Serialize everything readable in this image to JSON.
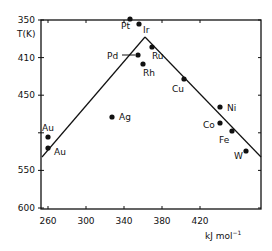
{
  "chart_data": {
    "type": "scatter",
    "title": "",
    "ylabel": "T(K)",
    "xlabel": "kJ mol⁻¹",
    "x_ticks": [
      260,
      300,
      340,
      380,
      420
    ],
    "y_ticks": [
      {
        "label": "350",
        "px": 20
      },
      {
        "label": "410",
        "px": 57.6
      },
      {
        "label": "450",
        "px": 95.2
      },
      {
        "label": "",
        "px": 132.8
      },
      {
        "label": "550",
        "px": 170.4
      },
      {
        "label": "600",
        "px": 208
      }
    ],
    "xlim": [
      253,
      480
    ],
    "ylim_labels": [
      "350",
      "600"
    ],
    "grid": false,
    "legend": null,
    "points": [
      {
        "name": "Pt",
        "x": 346,
        "px": [
          130,
          19
        ],
        "label_pos": [
          121,
          29
        ]
      },
      {
        "name": "Ir",
        "x": 356,
        "px": [
          139,
          24
        ],
        "label_pos": [
          143,
          33
        ]
      },
      {
        "name": "Pd",
        "x": 355,
        "px": [
          138,
          55
        ],
        "label_pos": [
          107,
          59
        ],
        "arrow": true
      },
      {
        "name": "Ru",
        "x": 369,
        "px": [
          152,
          47
        ],
        "label_pos": [
          152,
          59
        ]
      },
      {
        "name": "Rh",
        "x": 360,
        "px": [
          143,
          64
        ],
        "label_pos": [
          143,
          76
        ]
      },
      {
        "name": "Cu",
        "x": 403,
        "px": [
          184,
          79
        ],
        "label_pos": [
          172,
          92
        ]
      },
      {
        "name": "Ag",
        "x": 327,
        "px": [
          112,
          117
        ],
        "label_pos": [
          119,
          120
        ]
      },
      {
        "name": "Ni",
        "x": 441,
        "px": [
          220,
          107
        ],
        "label_pos": [
          227,
          111
        ]
      },
      {
        "name": "Co",
        "x": 441,
        "px": [
          220,
          123
        ],
        "label_pos": [
          203,
          128
        ]
      },
      {
        "name": "Fe",
        "x": 454,
        "px": [
          232,
          131
        ],
        "label_pos": [
          219,
          143
        ]
      },
      {
        "name": "W",
        "x": 468,
        "px": [
          246,
          151
        ],
        "label_pos": [
          234,
          159
        ]
      },
      {
        "name": "Au",
        "x": 260,
        "px": [
          48,
          137
        ],
        "label_pos": [
          42,
          131
        ]
      },
      {
        "name": "Au",
        "x": 260,
        "px": [
          48,
          148
        ],
        "label_pos": [
          54,
          155
        ]
      }
    ],
    "lines": [
      {
        "name": "left-branch",
        "from_px": [
          42,
          157
        ],
        "to_px": [
          145,
          37
        ]
      },
      {
        "name": "right-branch",
        "from_px": [
          145,
          37
        ],
        "to_px": [
          261,
          157
        ]
      }
    ]
  }
}
